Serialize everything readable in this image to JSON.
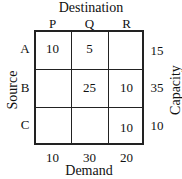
{
  "title": "Destination",
  "columns": [
    "P",
    "Q",
    "R"
  ],
  "rows": [
    {
      "label": "A",
      "cells": [
        "10",
        "5",
        ""
      ],
      "capacity": "15"
    },
    {
      "label": "B",
      "cells": [
        "",
        "25",
        "10"
      ],
      "capacity": "35"
    },
    {
      "label": "C",
      "cells": [
        "",
        "",
        "10"
      ],
      "capacity": "10"
    }
  ],
  "demand": [
    "10",
    "30",
    "20"
  ],
  "row_axis_label": "Source",
  "capacity_label": "Capacity",
  "demand_label": "Demand"
}
